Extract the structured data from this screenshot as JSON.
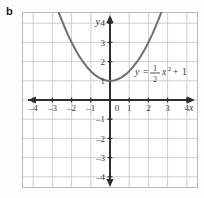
{
  "figure": {
    "part_label": "b"
  },
  "chart_data": {
    "type": "line",
    "title": "",
    "subtitle": "",
    "xlabel": "x",
    "ylabel": "y",
    "equation_label": "y = ½x² + 1",
    "equation_parts": {
      "lhs": "y",
      "equals": "=",
      "fraction_numerator": "1",
      "fraction_denominator": "2",
      "variable": "x",
      "exponent": "2",
      "plus": "+",
      "constant": "1"
    },
    "xlim": [
      -4.7,
      4.7
    ],
    "ylim": [
      -4.7,
      4.7
    ],
    "xticks": [
      -4,
      -3,
      -2,
      -1,
      0,
      1,
      2,
      3,
      4
    ],
    "yticks": [
      -4,
      -3,
      -2,
      -1,
      1,
      2,
      3,
      4
    ],
    "xtick_labels": [
      "-4",
      "-3",
      "-2",
      "-1",
      "0",
      "1",
      "2",
      "3",
      "4"
    ],
    "ytick_labels": [
      "-4",
      "-3",
      "-2",
      "-1",
      "1",
      "2",
      "3",
      "4"
    ],
    "origin_label": "0",
    "grid": true,
    "grid_step": 1,
    "legend": "none",
    "series": [
      {
        "name": "y = 1/2 x^2 + 1",
        "vertex": [
          0,
          1
        ],
        "x": [
          -2.85,
          -2.6,
          -2.4,
          -2.2,
          -2.0,
          -1.8,
          -1.6,
          -1.4,
          -1.2,
          -1.0,
          -0.8,
          -0.6,
          -0.4,
          -0.2,
          0.0,
          0.2,
          0.4,
          0.6,
          0.8,
          1.0,
          1.2,
          1.4,
          1.6,
          1.8,
          2.0,
          2.2,
          2.4,
          2.6,
          2.85
        ],
        "values": [
          5.06,
          4.38,
          3.88,
          3.42,
          3.0,
          2.62,
          2.28,
          1.98,
          1.72,
          1.5,
          1.32,
          1.18,
          1.08,
          1.02,
          1.0,
          1.02,
          1.08,
          1.18,
          1.32,
          1.5,
          1.72,
          1.98,
          2.28,
          2.62,
          3.0,
          3.42,
          3.88,
          4.38,
          5.06
        ]
      }
    ]
  },
  "colors": {
    "curve": "#6f6f72",
    "axis": "#2e2e2e",
    "grid": "#c9c9cd",
    "frame": "#b8b8bc",
    "text": "#3a3a3a",
    "label_bold": "#1a1a1a"
  }
}
